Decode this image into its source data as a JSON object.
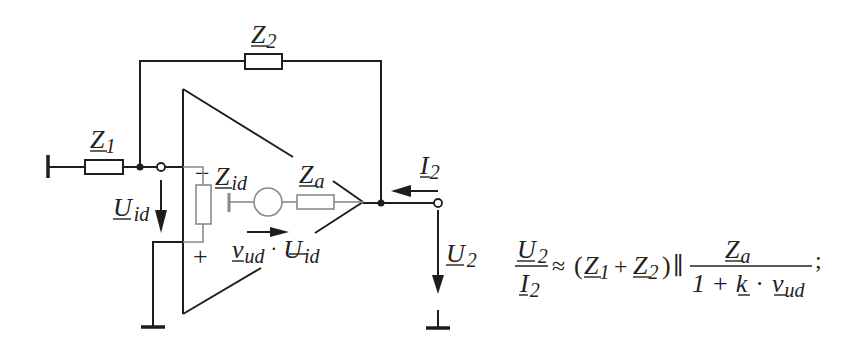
{
  "diagram": {
    "type": "circuit-schematic",
    "labels": {
      "z2": {
        "base": "Z",
        "sub": "2"
      },
      "z1": {
        "base": "Z",
        "sub": "1"
      },
      "zid": {
        "base": "Z",
        "sub": "id"
      },
      "za": {
        "base": "Z",
        "sub": "a"
      },
      "i2": {
        "base": "I",
        "sub": "2"
      },
      "uid": {
        "base": "U",
        "sub": "id"
      },
      "u2": {
        "base": "U",
        "sub": "2"
      },
      "source": {
        "v_base": "v",
        "v_sub": "ud",
        "dot": "·",
        "u_base": "U",
        "u_sub": "id"
      },
      "minus": "−",
      "plus": "+"
    },
    "colors": {
      "line": "#1e1e1e",
      "internal": "#8a8a8a",
      "background": "#ffffff"
    }
  },
  "formula": {
    "lhs_num": {
      "base": "U",
      "sub": "2"
    },
    "lhs_den": {
      "base": "I",
      "sub": "2"
    },
    "approx": "≈",
    "open_paren": "(",
    "z1": {
      "base": "Z",
      "sub": "1"
    },
    "plus": "+",
    "z2": {
      "base": "Z",
      "sub": "2"
    },
    "close_paren": ")",
    "parallel": "∥",
    "rhs_num": {
      "base": "Z",
      "sub": "a"
    },
    "rhs_den": {
      "one": "1",
      "plus": "+",
      "k": "k",
      "dot": "·",
      "v": "v",
      "v_sub": "ud"
    },
    "terminator": ";"
  }
}
